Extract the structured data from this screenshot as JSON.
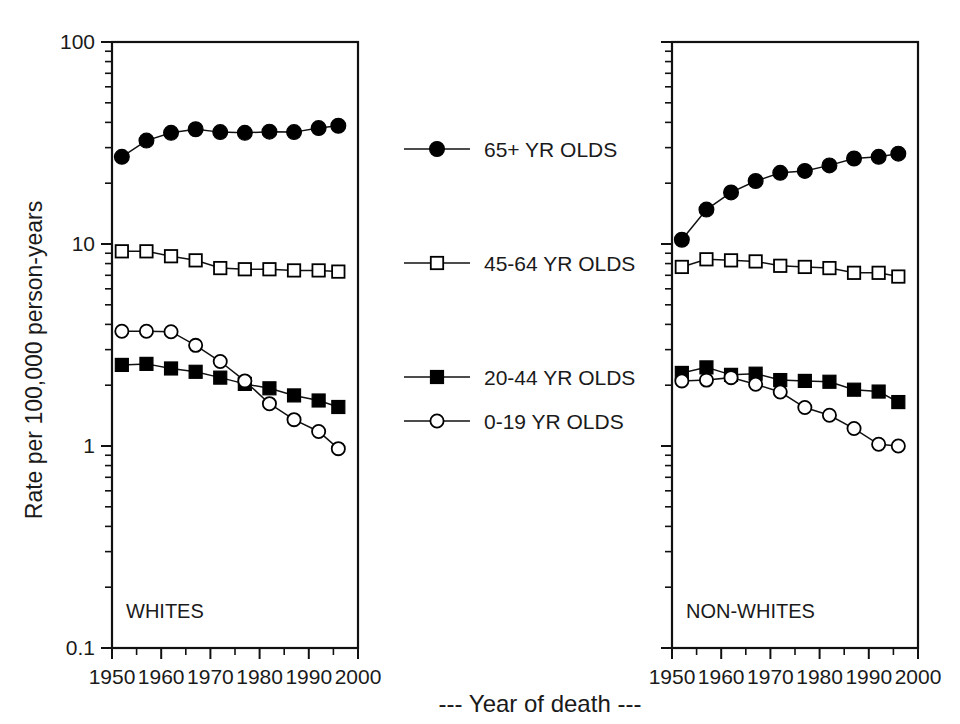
{
  "figure": {
    "ylabel": "Rate per 100,000 person-years",
    "xaxis_caption": "--- Year of death ---"
  },
  "legend": {
    "items": [
      {
        "label": "65+ YR OLDS",
        "marker": "filled-circle"
      },
      {
        "label": "45-64 YR OLDS",
        "marker": "open-square"
      },
      {
        "label": "20-44 YR OLDS",
        "marker": "filled-square"
      },
      {
        "label": "0-19 YR OLDS",
        "marker": "open-circle"
      }
    ]
  },
  "panels": [
    {
      "name": "WHITES",
      "label": "WHITES"
    },
    {
      "name": "NON-WHITES",
      "label": "NON-WHITES"
    }
  ],
  "axis": {
    "y_ticks": [
      "100",
      "10",
      "1",
      "0.1"
    ],
    "y_tick_values": [
      100,
      10,
      1,
      0.1
    ],
    "x_ticks": [
      "1950",
      "1960",
      "1970",
      "1980",
      "1990",
      "2000"
    ],
    "x_tick_values": [
      1950,
      1960,
      1970,
      1980,
      1990,
      2000
    ]
  },
  "chart_data": [
    {
      "type": "line",
      "title": "WHITES",
      "xlabel": "--- Year of death ---",
      "ylabel": "Rate per 100,000 person-years",
      "yscale": "log",
      "ylim": [
        0.1,
        100
      ],
      "xlim": [
        1950,
        2000
      ],
      "grid": false,
      "legend_position": "center-between-panels",
      "x": [
        1952,
        1957,
        1962,
        1967,
        1972,
        1977,
        1982,
        1987,
        1992,
        1996
      ],
      "series": [
        {
          "name": "65+ YR OLDS",
          "marker": "filled-circle",
          "values": [
            27.0,
            32.5,
            35.5,
            37.0,
            35.8,
            35.5,
            36.0,
            35.8,
            37.5,
            38.5
          ]
        },
        {
          "name": "45-64 YR OLDS",
          "marker": "open-square",
          "values": [
            9.2,
            9.2,
            8.7,
            8.3,
            7.6,
            7.5,
            7.5,
            7.4,
            7.4,
            7.3
          ]
        },
        {
          "name": "20-44 YR OLDS",
          "marker": "filled-square",
          "values": [
            2.52,
            2.55,
            2.42,
            2.33,
            2.18,
            2.03,
            1.93,
            1.78,
            1.68,
            1.56
          ]
        },
        {
          "name": "0-19 YR OLDS",
          "marker": "open-circle",
          "values": [
            3.7,
            3.7,
            3.68,
            3.15,
            2.62,
            2.1,
            1.62,
            1.35,
            1.18,
            0.97
          ]
        }
      ]
    },
    {
      "type": "line",
      "title": "NON-WHITES",
      "xlabel": "--- Year of death ---",
      "ylabel": "Rate per 100,000 person-years",
      "yscale": "log",
      "ylim": [
        0.1,
        100
      ],
      "xlim": [
        1950,
        2000
      ],
      "grid": false,
      "legend_position": "center-between-panels",
      "x": [
        1952,
        1957,
        1962,
        1967,
        1972,
        1977,
        1982,
        1987,
        1992,
        1996
      ],
      "series": [
        {
          "name": "65+ YR OLDS",
          "marker": "filled-circle",
          "values": [
            10.5,
            14.8,
            18.0,
            20.5,
            22.5,
            23.0,
            24.5,
            26.5,
            27.0,
            28.0
          ]
        },
        {
          "name": "45-64 YR OLDS",
          "marker": "open-square",
          "values": [
            7.7,
            8.4,
            8.3,
            8.2,
            7.8,
            7.7,
            7.6,
            7.2,
            7.2,
            6.9
          ]
        },
        {
          "name": "20-44 YR OLDS",
          "marker": "filled-square",
          "values": [
            2.3,
            2.45,
            2.25,
            2.28,
            2.12,
            2.1,
            2.08,
            1.9,
            1.86,
            1.65
          ]
        },
        {
          "name": "0-19 YR OLDS",
          "marker": "open-circle",
          "values": [
            2.1,
            2.12,
            2.18,
            2.02,
            1.85,
            1.55,
            1.42,
            1.22,
            1.02,
            1.0
          ]
        }
      ]
    }
  ]
}
